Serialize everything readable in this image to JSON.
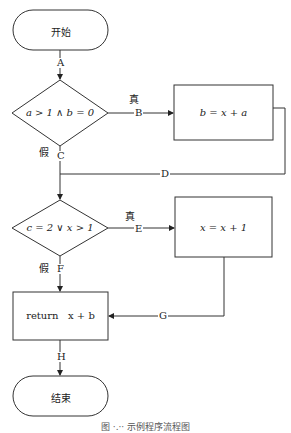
{
  "flowchart": {
    "start": {
      "label": "开始"
    },
    "decision1": {
      "label": "a > 1 ∧ b = 0",
      "true_label": "真",
      "false_label": "假"
    },
    "process1": {
      "label": "b = x + a"
    },
    "decision2": {
      "label": "c = 2 ∨ x > 1",
      "true_label": "真",
      "false_label": "假"
    },
    "process2": {
      "label": "x = x + 1"
    },
    "return_box": {
      "label": "return   x + b"
    },
    "end": {
      "label": "结束"
    },
    "edges": {
      "A": "A",
      "B": "B",
      "C": "C",
      "D": "D",
      "E": "E",
      "F": "F",
      "G": "G",
      "H": "H"
    }
  },
  "caption": "图 ·.·· 示例程序流程图"
}
